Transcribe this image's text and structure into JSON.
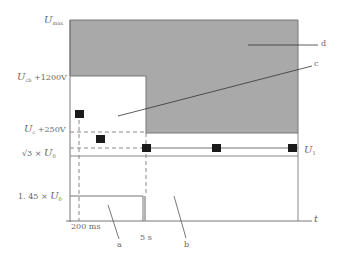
{
  "diagram": {
    "y_labels": {
      "umax": {
        "main": "U",
        "sub": "max"
      },
      "ucb_1200": {
        "main": "U",
        "sub": "cb",
        "suffix": " +1200V"
      },
      "uc_250": {
        "main": "U",
        "sub": "c",
        "suffix": " +250V"
      },
      "sqrt3_u0": {
        "prefix": "√3 × ",
        "main": "U",
        "sub": "0"
      },
      "u145_u0": {
        "prefix": "1. 45 × ",
        "main": "U",
        "sub": "0"
      }
    },
    "x_labels": {
      "t200ms": "200 ms",
      "t5s": "5 s",
      "t_axis": "t"
    },
    "line_labels": {
      "u1": {
        "main": "U",
        "sub": "1"
      }
    },
    "region_labels": {
      "a": "a",
      "b": "b",
      "c": "c",
      "d": "d"
    },
    "colors": {
      "shaded": "#a8a8a8",
      "line": "#777777",
      "marker": "#1a1a1a"
    }
  }
}
